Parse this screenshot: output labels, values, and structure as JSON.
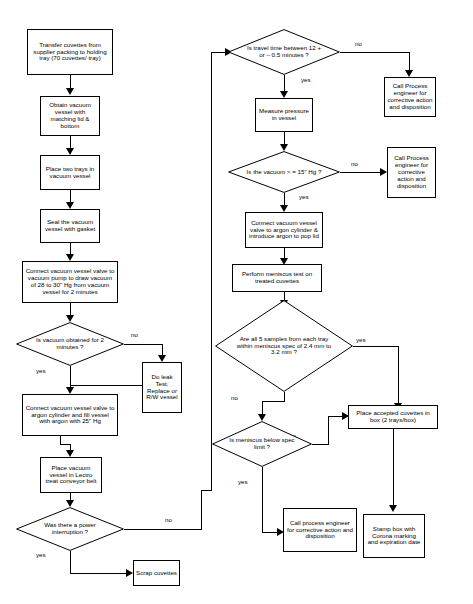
{
  "diagram": {
    "background": "#ffffff",
    "stroke": "#000000",
    "nodes": {
      "transfer_cuvettes": "Transfer cuvettes from supplier packing to holding tray (70 cuvettes/ tray)",
      "obtain_vessel": "Obtain vacuum vessel with matching lid & bottom",
      "place_trays": "Place two trays in vacuum vessel",
      "seal_vessel": "Seal the vacuum  vessel with gasket",
      "connect_pump": "Connect vacuum vessel valve to vacuum pump to draw vacuum of 28 to 30\" Hg from vacuum vessel for 2 minutes",
      "vacuum_obtained_q": "Is vacuum obtained for 2 minutes ?",
      "do_leak_test": "Do leak Test. Replace or R/W vessel",
      "connect_argon_fill": "Connect vacuum vessel valve to argon cylinder and fill vessel with argon with 25\" Hg",
      "place_lectro": "Place vacuum vessel in Lectro treat conveyor belt",
      "power_interruption_q": "Was there a power interruption ?",
      "scrap_cuvettes": "Scrap cuvettes",
      "travel_time_q": "Is travel time between 12 + or – 0.5 minutes ?",
      "call_process_1": "Call Process engineer for corrective action and disposition",
      "measure_pressure": "Measure pressure in vessel",
      "vacuum_15_q": "Is the vacuum > = 15\" Hg ?",
      "call_process_2": "Call  Process engineer for corrective action and disposition",
      "connect_argon_pop": "Connect vacuum vessel valve to argon cylinder & introduce argon to pop lid",
      "meniscus_test": "Perform meniscus test on treated cuvettes",
      "samples_spec_q": "Are all 5 samples from each tray within meniscus spec of 2.4 mm to 3.2 mm ?",
      "meniscus_below_q": "Is meniscus below spec limit ?",
      "place_accepted": "Place accepted cuvettes in box (2 trays/box)",
      "call_process_3": "Call process engineer for corrective action and disposition",
      "stamp_box": "Stamp box with Corona marking and expiration date"
    },
    "edge_labels": {
      "vacuum_no": "no",
      "vacuum_yes": "yes",
      "power_no": "no",
      "power_yes": "yes",
      "travel_no": "no",
      "travel_yes": "yes",
      "vac15_no": "no",
      "vac15_yes": "yes",
      "samples_yes": "yes",
      "samples_no": "no",
      "meniscus_no": "no",
      "meniscus_yes": "yes"
    }
  }
}
